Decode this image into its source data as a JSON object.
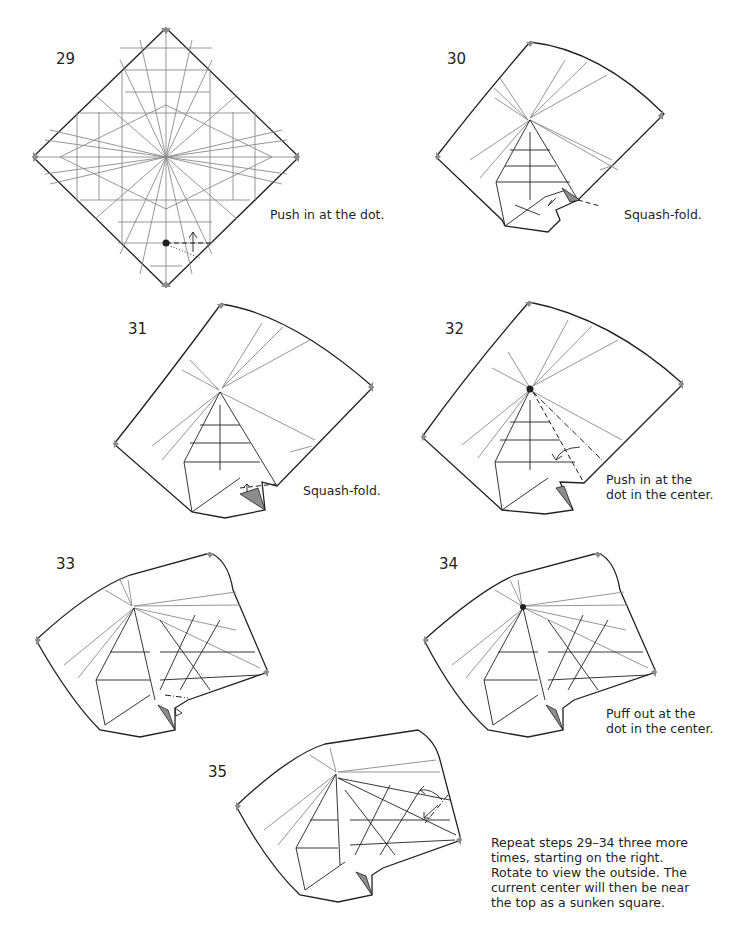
{
  "steps": [
    {
      "number": "29",
      "caption": [
        "Push in at the dot."
      ]
    },
    {
      "number": "30",
      "caption": [
        "Squash-fold."
      ]
    },
    {
      "number": "31",
      "caption": [
        "Squash-fold."
      ]
    },
    {
      "number": "32",
      "caption": [
        "Push in at the",
        "dot in the center."
      ]
    },
    {
      "number": "33",
      "caption": []
    },
    {
      "number": "34",
      "caption": [
        "Puff out at the",
        "dot in the center."
      ]
    },
    {
      "number": "35",
      "caption": [
        "Repeat steps 29–34 three more",
        "times, starting on the right.",
        "Rotate to view the outside. The",
        "current center will then be near",
        "the top as a sunken square."
      ]
    }
  ],
  "colors": {
    "line": "#231f20",
    "crease": "#8a8a8a",
    "shade": "#8c8c8c",
    "background": "#ffffff"
  }
}
